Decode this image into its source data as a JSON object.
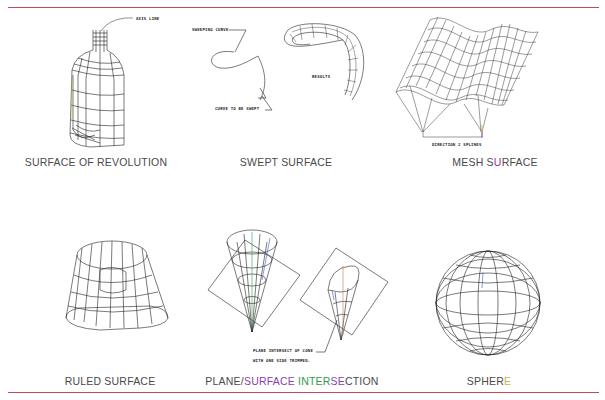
{
  "page": {
    "accent_rule_color": "#c2485a",
    "figures": [
      {
        "id": "surface-of-revolution",
        "caption": "SURFACE OF REVOLUTION",
        "annotations": [
          "AXIS LINE"
        ]
      },
      {
        "id": "swept-surface",
        "caption": "SWEPT SURFACE",
        "annotations": [
          "SWEEPING CURVE",
          "CURVE TO BE SWEPT",
          "RESULTS"
        ]
      },
      {
        "id": "mesh-surface",
        "caption_parts": [
          "MESH S",
          "U",
          "RFACE"
        ],
        "annotations": [
          "DIRECTION 2 SPLINES"
        ]
      },
      {
        "id": "ruled-surface",
        "caption": "RULED SURFACE",
        "annotations": []
      },
      {
        "id": "plane-surface-intersection",
        "caption_parts": [
          "PLANE/",
          "SURFACE ",
          "INTER",
          "SE",
          "CTION"
        ],
        "annotations": [
          "PLANE INTERSECT OF CONE",
          "WITH ONE SIDE TRIMMED."
        ]
      },
      {
        "id": "sphere",
        "caption_parts": [
          "SPHER",
          "E"
        ],
        "annotations": []
      }
    ]
  }
}
